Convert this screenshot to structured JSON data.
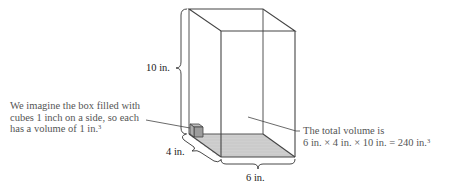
{
  "figure": {
    "type": "rectangular-box-volume-illustration",
    "colors": {
      "edge": "#444444",
      "hidden_edge": "#9a9a9a",
      "base_fill": "#cfcfcf",
      "cube_fill": "#9c9c9c",
      "text_dim": "#1a1a1a",
      "text_note": "#555555"
    }
  },
  "dimensions": {
    "height_label": "10 in.",
    "depth_label": "4 in.",
    "width_label": "6 in."
  },
  "annotations": {
    "cube_note": {
      "line1": "We imagine the box filled with",
      "line2": "cubes 1 inch on a side, so each",
      "line3_text": "has a volume of 1 in.",
      "line3_sup": "3"
    },
    "volume_note": {
      "line1": "The total volume is",
      "line2_text": "6 in. × 4 in. × 10 in. = 240 in.",
      "line2_sup": "3"
    }
  }
}
